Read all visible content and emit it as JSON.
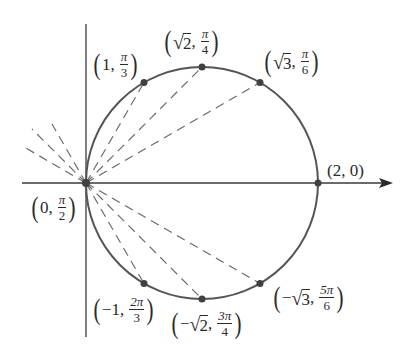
{
  "diagram": {
    "colors": {
      "curve": "#555555",
      "axis": "#3a3a3a",
      "dash": "#6a6a6a",
      "point": "#404040",
      "text": "#2a2a2a"
    },
    "scale_px_per_unit": 116,
    "origin_px": [
      86,
      183
    ],
    "axes": {
      "horizontal": {
        "x_start": 22,
        "x_end": 393,
        "arrow": true
      },
      "vertical": {
        "y_start": 24,
        "y_end": 337,
        "arrow": false
      }
    },
    "circle": {
      "center_px": [
        202,
        183
      ],
      "radius_px": 116
    },
    "points": [
      {
        "id": "p-1-pi3",
        "r": "1",
        "theta": "π/3",
        "px": [
          144,
          82.5
        ]
      },
      {
        "id": "p-sqrt2-pi4",
        "r": "√2",
        "theta": "π/4",
        "px": [
          202,
          67
        ]
      },
      {
        "id": "p-sqrt3-pi6",
        "r": "√3",
        "theta": "π/6",
        "px": [
          260,
          82.5
        ]
      },
      {
        "id": "p-2-0",
        "r": "2",
        "theta": "0",
        "px": [
          318,
          183
        ]
      },
      {
        "id": "p-0-pi2",
        "r": "0",
        "theta": "π/2",
        "px": [
          86,
          183
        ]
      },
      {
        "id": "p-neg1-2pi3",
        "r": "−1",
        "theta": "2π/3",
        "px": [
          144,
          283.5
        ]
      },
      {
        "id": "p-negsqrt2-3pi4",
        "r": "−√2",
        "theta": "3π/4",
        "px": [
          202,
          299
        ]
      },
      {
        "id": "p-negsqrt3-5pi6",
        "r": "−√3",
        "theta": "5π/6",
        "px": [
          260,
          283.5
        ]
      }
    ],
    "labels": {
      "l1": {
        "r": "1",
        "num": "π",
        "den": "3"
      },
      "l2": {
        "r_rad": "2",
        "num": "π",
        "den": "4"
      },
      "l3": {
        "r_rad": "3",
        "num": "π",
        "den": "6"
      },
      "l4": {
        "text": "(2, 0)"
      },
      "l5": {
        "r": "0",
        "num": "π",
        "den": "2"
      },
      "l6": {
        "r": "−1",
        "num": "2π",
        "den": "3"
      },
      "l7": {
        "sign": "−",
        "r_rad": "2",
        "num": "3π",
        "den": "4"
      },
      "l8": {
        "sign": "−",
        "r_rad": "3",
        "num": "5π",
        "den": "6"
      }
    }
  }
}
